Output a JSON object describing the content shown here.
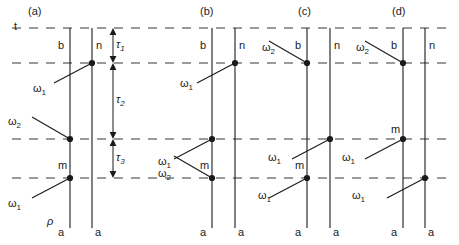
{
  "figure": {
    "type": "double-sided-feynman-diagram",
    "time_axis_label": "t",
    "density_matrix_label": "ρ",
    "background_color": "#ffffff",
    "line_color": "#1a1a1a",
    "dash_color": "#7a7a7a"
  },
  "geometry": {
    "width": 459,
    "height": 245,
    "dashed_lines_y": [
      28,
      63,
      139,
      178
    ],
    "bottom_y": 228,
    "tau_axis_x": 113
  },
  "intervals": [
    {
      "name": "tau1",
      "symbol": "τ",
      "subscript": "1",
      "from_y": 28,
      "to_y": 63
    },
    {
      "name": "tau2",
      "symbol": "τ",
      "subscript": "2",
      "from_y": 63,
      "to_y": 139
    },
    {
      "name": "tau3",
      "symbol": "τ",
      "subscript": "3",
      "from_y": 139,
      "to_y": 178
    }
  ],
  "panels": [
    {
      "id": "a",
      "label": "(a)",
      "label_x": 28,
      "left_x": 70,
      "right_x": 92,
      "ket_top_label": "b",
      "bra_top_label": "n",
      "ket_bottom_label": "a",
      "bra_bottom_label": "a",
      "mid_state_label": "m",
      "mid_state_y": 160,
      "interactions": [
        {
          "field": "ω",
          "sub": "1",
          "y": 63,
          "side": "right",
          "arrow_from": "lower-left",
          "label_x": 33,
          "label_y": 83
        },
        {
          "field": "ω",
          "sub": "2",
          "y": 139,
          "side": "left",
          "arrow_from": "upper-left",
          "label_x": 8,
          "label_y": 116
        },
        {
          "field": "ω",
          "sub": "1",
          "y": 178,
          "side": "left",
          "arrow_from": "lower-left",
          "label_x": 8,
          "label_y": 198
        }
      ]
    },
    {
      "id": "b",
      "label": "(b)",
      "label_x": 200,
      "left_x": 212,
      "right_x": 235,
      "ket_top_label": "b",
      "bra_top_label": "n",
      "ket_bottom_label": "a",
      "bra_bottom_label": "a",
      "mid_state_label": "m",
      "mid_state_y": 160,
      "interactions": [
        {
          "field": "ω",
          "sub": "1",
          "y": 63,
          "side": "right",
          "arrow_from": "lower-left",
          "label_x": 180,
          "label_y": 78
        },
        {
          "field": "ω",
          "sub": "1",
          "y": 139,
          "side": "left",
          "arrow_from": "lower-left",
          "label_x": 158,
          "label_y": 156
        },
        {
          "field": "ω",
          "sub": "2",
          "y": 178,
          "side": "left",
          "arrow_from": "upper-left",
          "label_x": 158,
          "label_y": 168
        }
      ]
    },
    {
      "id": "c",
      "label": "(c)",
      "label_x": 298,
      "left_x": 307,
      "right_x": 330,
      "ket_top_label": "b",
      "bra_top_label": "n",
      "ket_bottom_label": "a",
      "bra_bottom_label": "a",
      "mid_state_label": "m",
      "mid_state_y": 160,
      "interactions": [
        {
          "field": "ω",
          "sub": "2",
          "y": 63,
          "side": "left",
          "arrow_from": "upper-left",
          "label_x": 262,
          "label_y": 42
        },
        {
          "field": "ω",
          "sub": "1",
          "y": 139,
          "side": "right",
          "arrow_from": "lower-left",
          "label_x": 268,
          "label_y": 152
        },
        {
          "field": "ω",
          "sub": "1",
          "y": 178,
          "side": "left",
          "arrow_from": "lower-left",
          "label_x": 258,
          "label_y": 190
        }
      ]
    },
    {
      "id": "d",
      "label": "(d)",
      "label_x": 392,
      "left_x": 403,
      "right_x": 425,
      "ket_top_label": "b",
      "bra_top_label": "n",
      "ket_bottom_label": "a",
      "bra_bottom_label": "a",
      "mid_state_label": "m",
      "mid_state_y": 124,
      "interactions": [
        {
          "field": "ω",
          "sub": "2",
          "y": 63,
          "side": "left",
          "arrow_from": "upper-left",
          "label_x": 356,
          "label_y": 42
        },
        {
          "field": "ω",
          "sub": "1",
          "y": 139,
          "side": "left",
          "arrow_from": "lower-left",
          "label_x": 342,
          "label_y": 152
        },
        {
          "field": "ω",
          "sub": "1",
          "y": 178,
          "side": "right",
          "arrow_from": "lower-left",
          "label_x": 352,
          "label_y": 190
        }
      ]
    }
  ]
}
